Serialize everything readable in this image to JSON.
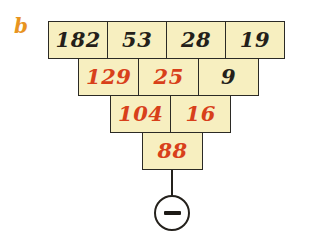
{
  "panel": {
    "label": "b",
    "label_color": "#e8941f"
  },
  "colors": {
    "cell_fill": "#f7efc0",
    "cell_border": "#2b2a25",
    "ink_dark": "#241f1a",
    "ink_red": "#d8401a",
    "page_background": "#ffffff"
  },
  "diagram": {
    "type": "subtraction-pyramid",
    "operation_symbol": "−",
    "operation_name": "minus-sign",
    "rows": [
      {
        "index": 1,
        "cells": [
          {
            "value": "182",
            "ink": "dark"
          },
          {
            "value": "53",
            "ink": "dark"
          },
          {
            "value": "28",
            "ink": "dark"
          },
          {
            "value": "19",
            "ink": "dark"
          }
        ]
      },
      {
        "index": 2,
        "cells": [
          {
            "value": "129",
            "ink": "red"
          },
          {
            "value": "25",
            "ink": "red"
          },
          {
            "value": "9",
            "ink": "dark"
          }
        ]
      },
      {
        "index": 3,
        "cells": [
          {
            "value": "104",
            "ink": "red"
          },
          {
            "value": "16",
            "ink": "red"
          }
        ]
      },
      {
        "index": 4,
        "cells": [
          {
            "value": "88",
            "ink": "red"
          }
        ]
      }
    ]
  }
}
